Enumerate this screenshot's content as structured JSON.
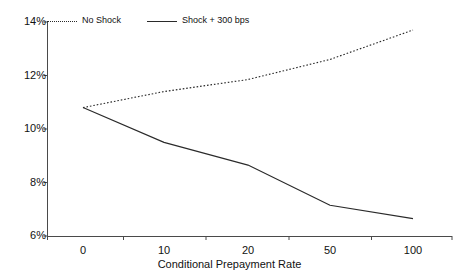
{
  "chart_data": {
    "type": "line",
    "title": "",
    "xlabel": "Conditional Prepayment Rate",
    "ylabel": "",
    "categories": [
      "0",
      "10",
      "20",
      "50",
      "100"
    ],
    "ytick_labels": [
      "6%",
      "8%",
      "10%",
      "12%",
      "14%"
    ],
    "ytick_values": [
      6,
      8,
      10,
      12,
      14
    ],
    "ylim": [
      6,
      14
    ],
    "grid": false,
    "legend_position": "top-left",
    "series": [
      {
        "name": "No Shock",
        "style": "dotted",
        "color": "#2a2a2a",
        "values": [
          10.8,
          11.4,
          11.85,
          12.6,
          13.7
        ]
      },
      {
        "name": "Shock + 300 bps",
        "style": "solid",
        "color": "#2a2a2a",
        "values": [
          10.8,
          9.5,
          8.65,
          7.15,
          6.65
        ]
      }
    ]
  },
  "axes": {
    "y_axis_name": "y-axis",
    "x_axis_name": "x-axis"
  }
}
